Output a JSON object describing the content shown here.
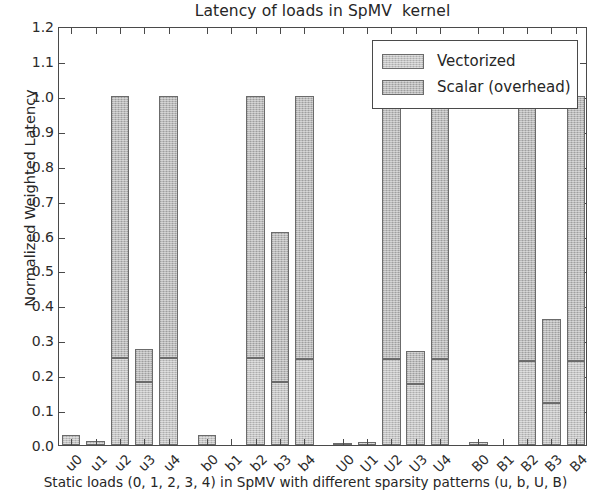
{
  "chart_data": {
    "type": "bar",
    "title": "Latency of loads in SpMV  kernel",
    "xlabel": "Static loads (0, 1, 2, 3, 4) in SpMV with different sparsity patterns (u, b, U, B)",
    "ylabel": "Normalized Weighted Latency",
    "ylim": [
      0.0,
      1.2
    ],
    "ytick_labels": [
      "0.0",
      "0.1",
      "0.2",
      "0.3",
      "0.4",
      "0.5",
      "0.6",
      "0.7",
      "0.8",
      "0.9",
      "1.0",
      "1.1",
      "1.2"
    ],
    "ytick_values": [
      0.0,
      0.1,
      0.2,
      0.3,
      0.4,
      0.5,
      0.6,
      0.7,
      0.8,
      0.9,
      1.0,
      1.1,
      1.2
    ],
    "grid": false,
    "stacked": true,
    "legend_position": "upper right",
    "categories": [
      "u0",
      "u1",
      "u2",
      "u3",
      "u4",
      "b0",
      "b1",
      "b2",
      "b3",
      "b4",
      "U0",
      "U1",
      "U2",
      "U3",
      "U4",
      "B0",
      "B1",
      "B2",
      "B3",
      "B4"
    ],
    "series": [
      {
        "name": "Vectorized",
        "color": "#c3c3c3",
        "values": [
          0.03,
          0.012,
          0.25,
          0.18,
          0.25,
          0.03,
          0.0,
          0.25,
          0.18,
          0.245,
          0.006,
          0.01,
          0.245,
          0.175,
          0.245,
          0.008,
          0.0,
          0.24,
          0.12,
          0.24
        ]
      },
      {
        "name": "Scalar (overhead)",
        "color": "#b9b9b9",
        "values": [
          0.0,
          0.0,
          0.75,
          0.095,
          0.75,
          0.0,
          0.0,
          0.75,
          0.43,
          0.755,
          0.0,
          0.0,
          0.755,
          0.095,
          0.755,
          0.0,
          0.0,
          0.76,
          0.24,
          0.76
        ]
      }
    ],
    "totals": [
      0.03,
      0.012,
      1.0,
      0.275,
      1.0,
      0.03,
      0.0,
      1.0,
      0.61,
      1.0,
      0.006,
      0.01,
      1.0,
      0.27,
      1.0,
      0.008,
      0.0,
      1.0,
      0.36,
      1.0
    ]
  },
  "legend": {
    "items": [
      {
        "label": "Vectorized"
      },
      {
        "label": "Scalar (overhead)"
      }
    ]
  }
}
